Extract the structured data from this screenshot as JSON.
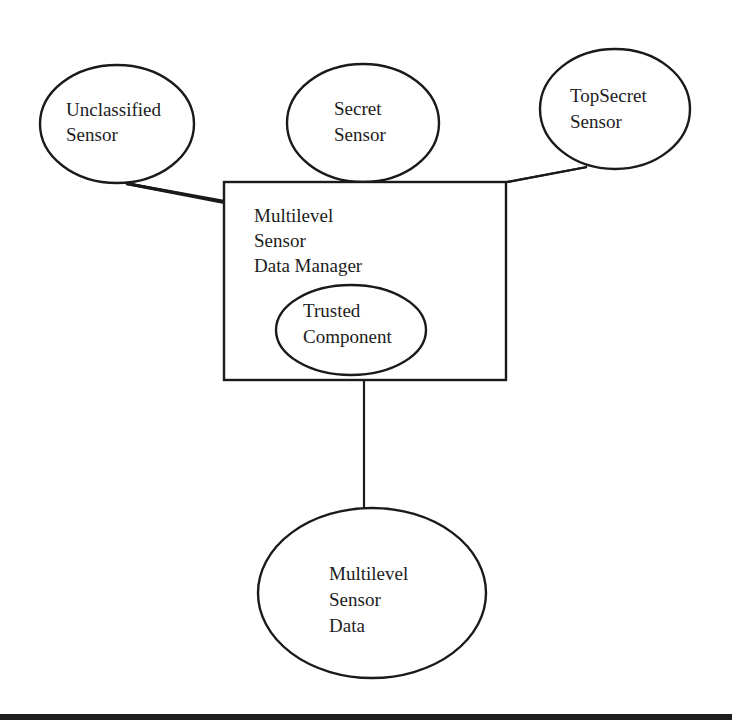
{
  "diagram": {
    "nodes": {
      "unclassified_sensor": {
        "lines": [
          "Unclassified",
          "Sensor"
        ]
      },
      "secret_sensor": {
        "lines": [
          "Secret",
          "Sensor"
        ]
      },
      "topsecret_sensor": {
        "lines": [
          "TopSecret",
          "Sensor"
        ]
      },
      "data_manager": {
        "lines": [
          "Multilevel",
          "Sensor",
          "Data Manager"
        ]
      },
      "trusted_component": {
        "lines": [
          "Trusted",
          "Component"
        ]
      },
      "sensor_data": {
        "lines": [
          "Multilevel",
          "Sensor",
          "Data"
        ]
      }
    },
    "edges": [
      {
        "from": "Unclassified Sensor",
        "to": "Multilevel Sensor Data Manager"
      },
      {
        "from": "Secret Sensor",
        "to": "Multilevel Sensor Data Manager"
      },
      {
        "from": "TopSecret Sensor",
        "to": "Multilevel Sensor Data Manager"
      },
      {
        "from": "Multilevel Sensor Data Manager",
        "to": "Multilevel Sensor Data"
      }
    ],
    "colors": {
      "stroke": "#1a1a1a",
      "background": "#ffffff"
    }
  }
}
